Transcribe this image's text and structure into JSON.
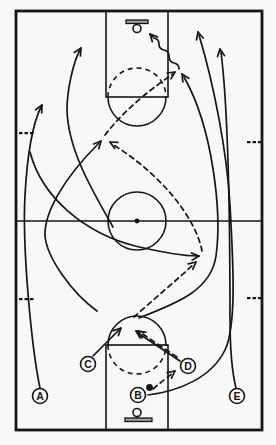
{
  "diagram": {
    "kind": "basketball-play-diagram",
    "colors": {
      "line": "#161616",
      "board_fill": "#a0a0a0",
      "paper": "#f8f8f6"
    },
    "court": {
      "boundary": {
        "x": 16,
        "y": 11,
        "w": 246,
        "h": 419
      },
      "midline_y": 221,
      "center_circle": {
        "cx": 137,
        "cy": 221,
        "r": 29,
        "dot_r": 2.4
      },
      "top_key": {
        "x": 106,
        "y": 11,
        "w": 62,
        "h": 86,
        "ft_circle": {
          "cx": 137,
          "cy": 97,
          "r": 29,
          "dashed_half": "top"
        }
      },
      "bottom_key": {
        "x": 106,
        "y": 345,
        "w": 62,
        "h": 85,
        "ft_circle": {
          "cx": 137,
          "cy": 345,
          "r": 29,
          "dashed_half": "bottom"
        }
      },
      "top_basket": {
        "board": {
          "x": 126,
          "y": 20,
          "w": 22,
          "h": 3.5
        },
        "rim": {
          "cx": 137,
          "cy": 28.5,
          "r": 4
        },
        "stem": [
          137,
          23.5,
          137,
          24.5
        ]
      },
      "bottom_basket": {
        "board": {
          "x": 125,
          "y": 418,
          "w": 27,
          "h": 3.5
        },
        "rim": {
          "cx": 137,
          "cy": 412.5,
          "r": 4
        },
        "stem": [
          137,
          416.5,
          137,
          418
        ]
      },
      "hash_marks": [
        {
          "x": 19,
          "y": 132
        },
        {
          "x": 19,
          "y": 298
        },
        {
          "x": 247,
          "y": 141
        },
        {
          "x": 247,
          "y": 297
        }
      ],
      "hash_dash": {
        "w": 3.5,
        "h": 2.2,
        "gap": 2
      }
    },
    "players": [
      {
        "label": "A",
        "cx": 40,
        "cy": 396
      },
      {
        "label": "B",
        "cx": 138,
        "cy": 395
      },
      {
        "label": "C",
        "cx": 88,
        "cy": 364
      },
      {
        "label": "D",
        "cx": 188,
        "cy": 366
      },
      {
        "label": "E",
        "cx": 237,
        "cy": 396
      }
    ],
    "player_radius": 7.5,
    "ball": {
      "cx": 149.5,
      "cy": 387.5,
      "r": 3.4
    },
    "arrows": [
      {
        "name": "cut-A-up-left-side",
        "style": "solid",
        "d": "M 40 388 C 32 350 22 250 25 195 C 27 160 31 127 41 107",
        "tip": [
          42,
          105
        ],
        "angle": -62
      },
      {
        "name": "cut-upper-left-wing",
        "style": "solid",
        "d": "M 113 227 C 92 190 68 150 67 110 C 67 90 73 63 80 50",
        "tip": [
          81,
          48
        ],
        "angle": -60
      },
      {
        "name": "sweep-left-to-right-block",
        "style": "solid",
        "d": "M 30 152 C 42 198 85 233 135 246 C 165 253 185 256 197 256",
        "tip": [
          199,
          256
        ],
        "angle": -5
      },
      {
        "name": "hook-to-left-elbow",
        "style": "solid",
        "d": "M 97 311 C 72 293 47 258 45 236 C 44 214 62 180 99 143",
        "tip": [
          101,
          141
        ],
        "angle": -48
      },
      {
        "name": "hook-to-right-elbow",
        "style": "solid",
        "d": "M 139 318 C 175 304 211 291 216 256 C 222 213 213 128 184 77",
        "tip": [
          182,
          74
        ],
        "angle": -122
      },
      {
        "name": "cut-C-to-spot",
        "style": "solid",
        "d": "M 93 356 L 119 330",
        "tip": [
          121,
          328
        ],
        "angle": -45
      },
      {
        "name": "cut-D-to-spot",
        "style": "solid",
        "d": "M 180 361 L 138 333",
        "tip": [
          136,
          331
        ],
        "angle": -146
      },
      {
        "name": "run-B-right-sideline",
        "style": "solid",
        "d": "M 148 395 C 180 391 212 377 225 350 C 237 325 233 260 230 205 C 227 152 214 85 199 35",
        "tip": [
          198,
          32
        ],
        "angle": -105
      },
      {
        "name": "cut-E-up-right-side",
        "style": "solid",
        "d": "M 236 388 C 232 372 230 350 230 318 C 230 230 229 115 221 52",
        "tip": [
          220,
          49
        ],
        "angle": -98
      },
      {
        "name": "pass-B-to-D",
        "style": "dashed",
        "d": "M 153 389 C 161 382 168 377 173 373",
        "tip": [
          175,
          371
        ],
        "angle": -38
      },
      {
        "name": "pass-D-to-spot",
        "style": "dashed",
        "d": "M 177 357 C 162 347 150 339 140 332",
        "tip": [
          138,
          331
        ],
        "angle": -145
      },
      {
        "name": "pass-spot-to-right-block",
        "style": "dashed",
        "d": "M 134 317 C 153 300 179 278 194 264",
        "tip": [
          196,
          262
        ],
        "angle": -40
      },
      {
        "name": "pass-up-to-left-elbow",
        "style": "dashed",
        "d": "M 202 251 C 196 218 160 173 112 144",
        "tip": [
          110,
          142
        ],
        "angle": -152
      },
      {
        "name": "pass-to-high-post",
        "style": "dashed",
        "d": "M 105 135 C 124 110 152 88 173 74",
        "tip": [
          175,
          72
        ],
        "angle": -33
      },
      {
        "name": "dribble-shot-to-basket",
        "style": "wavy",
        "d": "M 179 69 Q 179 64 174 63 Q 169 62 169 56 Q 169 51 164 50 Q 159 49 159 44 Q 159 39 154 38 L 151 35",
        "tip": [
          150,
          34
        ],
        "angle": -133
      }
    ]
  }
}
